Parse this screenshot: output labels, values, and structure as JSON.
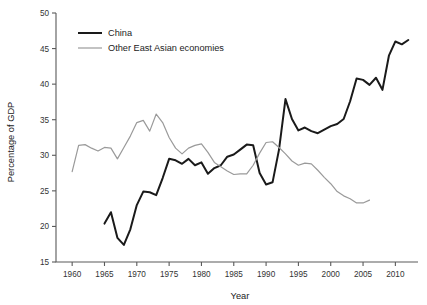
{
  "chart_data": {
    "type": "line",
    "title": "",
    "xlabel": "Year",
    "ylabel": "Percentage of GDP",
    "xlim": [
      1957.5,
      2013.5
    ],
    "ylim": [
      15,
      50
    ],
    "xticks": [
      1960,
      1965,
      1970,
      1975,
      1980,
      1985,
      1990,
      1995,
      2000,
      2005,
      2010
    ],
    "yticks": [
      15,
      20,
      25,
      30,
      35,
      40,
      45,
      50
    ],
    "xtick_labels": [
      "1960",
      "1965",
      "1970",
      "1975",
      "1980",
      "1985",
      "1990",
      "1995",
      "2000",
      "2005",
      "2010"
    ],
    "ytick_labels": [
      "15",
      "20",
      "25",
      "30",
      "35",
      "40",
      "45",
      "50"
    ],
    "grid": false,
    "legend_position": "top-left",
    "series": [
      {
        "name": "China",
        "color": "#1a1a1a",
        "width": 2.0,
        "x": [
          1965,
          1966,
          1967,
          1968,
          1969,
          1970,
          1971,
          1972,
          1973,
          1974,
          1975,
          1976,
          1977,
          1978,
          1979,
          1980,
          1981,
          1982,
          1983,
          1984,
          1985,
          1986,
          1987,
          1988,
          1989,
          1990,
          1991,
          1992,
          1993,
          1994,
          1995,
          1996,
          1997,
          1998,
          1999,
          2000,
          2001,
          2002,
          2003,
          2004,
          2005,
          2006,
          2007,
          2008,
          2009,
          2010,
          2011,
          2012
        ],
        "values": [
          20.4,
          22.0,
          18.4,
          17.4,
          19.6,
          23.0,
          24.9,
          24.8,
          24.4,
          26.8,
          29.5,
          29.3,
          28.8,
          29.5,
          28.6,
          29.0,
          27.4,
          28.2,
          28.6,
          29.8,
          30.1,
          30.8,
          31.5,
          31.4,
          27.5,
          25.9,
          26.2,
          30.8,
          37.9,
          35.1,
          33.5,
          33.9,
          33.4,
          33.1,
          33.6,
          34.1,
          34.4,
          35.1,
          37.6,
          40.8,
          40.6,
          39.9,
          40.9,
          39.2,
          44.0,
          46.0,
          45.6,
          46.2
        ]
      },
      {
        "name": "Other East Asian economies",
        "color": "#9a9a9a",
        "width": 1.2,
        "x": [
          1960,
          1961,
          1962,
          1963,
          1964,
          1965,
          1966,
          1967,
          1968,
          1969,
          1970,
          1971,
          1972,
          1973,
          1974,
          1975,
          1976,
          1977,
          1978,
          1979,
          1980,
          1981,
          1982,
          1983,
          1984,
          1985,
          1986,
          1987,
          1988,
          1989,
          1990,
          1991,
          1992,
          1993,
          1994,
          1995,
          1996,
          1997,
          1998,
          1999,
          2000,
          2001,
          2002,
          2003,
          2004,
          2005,
          2006
        ],
        "values": [
          27.7,
          31.4,
          31.5,
          31.0,
          30.6,
          31.1,
          31.0,
          29.5,
          31.1,
          32.7,
          34.6,
          34.9,
          33.4,
          35.8,
          34.6,
          32.5,
          31.0,
          30.2,
          31.0,
          31.4,
          31.6,
          30.4,
          29.0,
          28.4,
          27.8,
          27.3,
          27.4,
          27.4,
          28.6,
          30.3,
          31.8,
          31.9,
          31.1,
          30.2,
          29.2,
          28.6,
          28.9,
          28.8,
          27.9,
          26.9,
          26.0,
          24.9,
          24.3,
          23.9,
          23.3,
          23.3,
          23.7
        ]
      }
    ]
  },
  "legend": {
    "items": [
      {
        "label": "China",
        "color": "#1a1a1a"
      },
      {
        "label": "Other East Asian economies",
        "color": "#9a9a9a"
      }
    ]
  }
}
